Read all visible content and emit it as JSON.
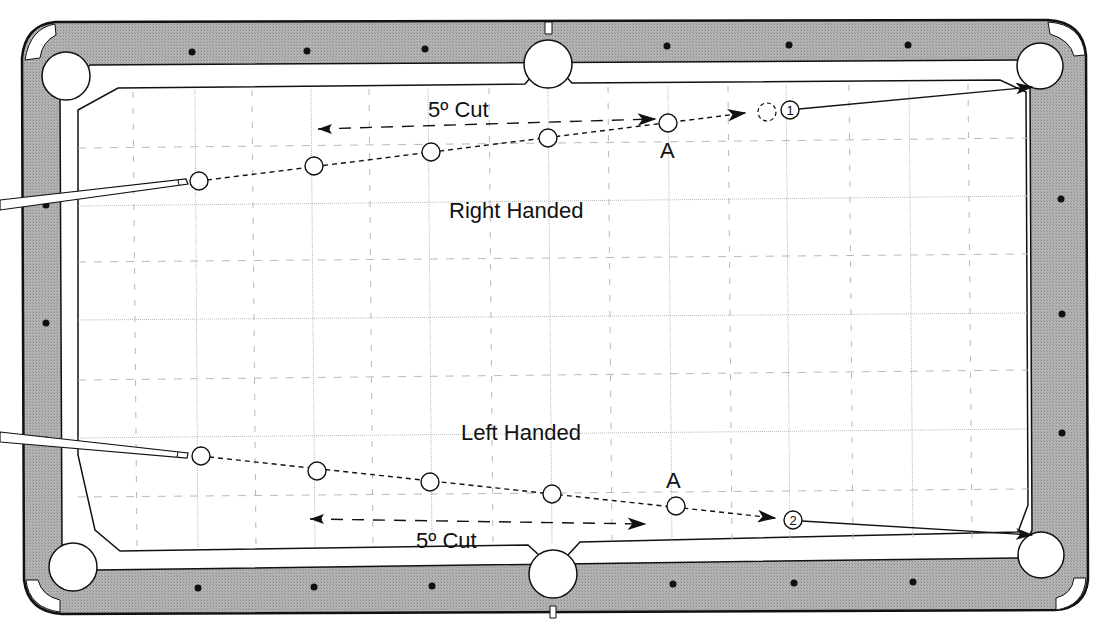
{
  "diagram": {
    "colors": {
      "rail": "#a9a9a9",
      "cushion": "#ffffff",
      "cloth": "#ffffff",
      "outline": "#111111",
      "grid": "#b8b8b8",
      "diamond": "#111111"
    },
    "labels": {
      "right_handed": "Right Handed",
      "left_handed": "Left Handed",
      "cut_top": "5º Cut",
      "cut_bottom": "5º Cut",
      "point_a_top": "A",
      "point_a_bottom": "A",
      "target_1": "1",
      "target_2": "2"
    },
    "shots": [
      {
        "name": "right-handed",
        "cue_ball": [
          199,
          181
        ],
        "path_balls": [
          [
            314,
            166
          ],
          [
            431,
            152
          ],
          [
            548,
            138
          ],
          [
            668,
            123
          ]
        ],
        "ghost_ball": [
          767,
          112
        ],
        "target_ball": [
          790,
          110
        ],
        "pocket_target": [
          1036,
          87
        ],
        "cut_arrow": {
          "from": [
            655,
            118
          ],
          "to": [
            318,
            129
          ]
        }
      },
      {
        "name": "left-handed",
        "cue_ball": [
          201,
          456
        ],
        "path_balls": [
          [
            317,
            471
          ],
          [
            430,
            482
          ],
          [
            552,
            494
          ],
          [
            676,
            506
          ]
        ],
        "target_ball": [
          793,
          520
        ],
        "pocket_target": [
          1036,
          535
        ],
        "cut_arrow": {
          "from": [
            310,
            519
          ],
          "to": [
            645,
            524
          ]
        }
      }
    ],
    "rail_diamonds": {
      "top": [
        [
          192,
          52
        ],
        [
          307,
          51
        ],
        [
          425,
          49
        ],
        [
          667,
          46
        ],
        [
          789,
          45
        ],
        [
          908,
          45
        ]
      ],
      "bottom": [
        [
          198,
          588
        ],
        [
          314,
          587
        ],
        [
          432,
          586
        ],
        [
          673,
          584
        ],
        [
          794,
          583
        ],
        [
          913,
          582
        ]
      ],
      "left": [
        [
          46,
          205
        ],
        [
          46,
          323
        ],
        [
          46,
          440
        ]
      ],
      "right": [
        [
          1061,
          199
        ],
        [
          1062,
          314
        ],
        [
          1062,
          433
        ]
      ]
    },
    "pockets": [
      {
        "name": "top-left",
        "x": 65,
        "y": 77
      },
      {
        "name": "top-center",
        "x": 548,
        "y": 66
      },
      {
        "name": "top-right",
        "x": 1040,
        "y": 67
      },
      {
        "name": "bottom-left",
        "x": 73,
        "y": 567
      },
      {
        "name": "bottom-center",
        "x": 553,
        "y": 574
      },
      {
        "name": "bottom-right",
        "x": 1041,
        "y": 555
      }
    ]
  }
}
